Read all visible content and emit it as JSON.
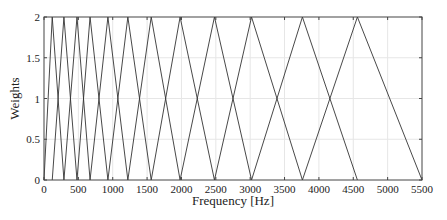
{
  "chart_data": {
    "type": "line",
    "title": "",
    "xlabel": "Frequency [Hz]",
    "ylabel": "Weights",
    "xlim": [
      0,
      5500
    ],
    "ylim": [
      0,
      2
    ],
    "grid": true,
    "legend": null,
    "xticks": [
      0,
      500,
      1000,
      1500,
      2000,
      2500,
      3000,
      3500,
      4000,
      4500,
      5000,
      5500
    ],
    "yticks": [
      0,
      0.5,
      1,
      1.5,
      2
    ],
    "ytick_labels": [
      "0",
      "0.5",
      "1",
      "1.5",
      "2"
    ],
    "peak_weight": 2,
    "filter_edges_hz": [
      0,
      120,
      290,
      480,
      670,
      930,
      1220,
      1560,
      1980,
      2480,
      3020,
      3760,
      4560,
      5500
    ],
    "series": [
      {
        "name": "filter 1",
        "x": [
          0,
          120,
          290
        ],
        "y": [
          0,
          2,
          0
        ]
      },
      {
        "name": "filter 2",
        "x": [
          120,
          290,
          480
        ],
        "y": [
          0,
          2,
          0
        ]
      },
      {
        "name": "filter 3",
        "x": [
          290,
          480,
          670
        ],
        "y": [
          0,
          2,
          0
        ]
      },
      {
        "name": "filter 4",
        "x": [
          480,
          670,
          930
        ],
        "y": [
          0,
          2,
          0
        ]
      },
      {
        "name": "filter 5",
        "x": [
          670,
          930,
          1220
        ],
        "y": [
          0,
          2,
          0
        ]
      },
      {
        "name": "filter 6",
        "x": [
          930,
          1220,
          1560
        ],
        "y": [
          0,
          2,
          0
        ]
      },
      {
        "name": "filter 7",
        "x": [
          1220,
          1560,
          1980
        ],
        "y": [
          0,
          2,
          0
        ]
      },
      {
        "name": "filter 8",
        "x": [
          1560,
          1980,
          2480
        ],
        "y": [
          0,
          2,
          0
        ]
      },
      {
        "name": "filter 9",
        "x": [
          1980,
          2480,
          3020
        ],
        "y": [
          0,
          2,
          0
        ]
      },
      {
        "name": "filter 10",
        "x": [
          2480,
          3020,
          3760
        ],
        "y": [
          0,
          2,
          0
        ]
      },
      {
        "name": "filter 11",
        "x": [
          3020,
          3760,
          4560
        ],
        "y": [
          0,
          2,
          0
        ]
      },
      {
        "name": "filter 12",
        "x": [
          3760,
          4560,
          5500
        ],
        "y": [
          0,
          2,
          0
        ]
      }
    ]
  },
  "colors": {
    "line": "#333333",
    "grid": "#e6e6e6",
    "axes": "#444444"
  }
}
